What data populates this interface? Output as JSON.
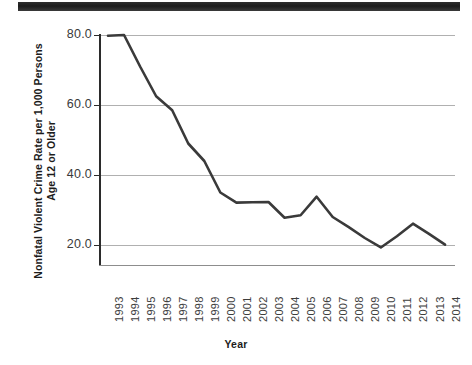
{
  "figure": {
    "scan_artifact": "page-edge-bar"
  },
  "chart_data": {
    "type": "line",
    "title": "",
    "xlabel": "Year",
    "ylabel": "Nonfatal Violent Crime Rate per 1,000 Persons Age 12 or Older",
    "ylabel_line1": "Nonfatal Violent Crime Rate per 1,000 Persons",
    "ylabel_line2": "Age 12 or Older",
    "categories": [
      "1993",
      "1994",
      "1995",
      "1996",
      "1997",
      "1998",
      "1999",
      "2000",
      "2001",
      "2002",
      "2003",
      "2004",
      "2005",
      "2006",
      "2007",
      "2008",
      "2009",
      "2010",
      "2011",
      "2012",
      "2013",
      "2014"
    ],
    "values": [
      79.8,
      80.0,
      71.0,
      62.5,
      58.5,
      49.0,
      44.0,
      35.0,
      32.1,
      32.2,
      32.3,
      27.8,
      28.5,
      33.8,
      28.0,
      25.1,
      22.0,
      19.3,
      22.5,
      26.1,
      23.2,
      20.1
    ],
    "ylim": [
      0,
      80
    ],
    "ytick_labels": [
      "80.0",
      "60.0",
      "40.0",
      "20.0"
    ],
    "ytick_values": [
      80,
      60,
      40,
      20
    ],
    "grid": true,
    "legend": "none",
    "series_color": "#3a3a3a",
    "grid_color": "#b0b0b0",
    "axis_color": "#2b2b2b"
  }
}
